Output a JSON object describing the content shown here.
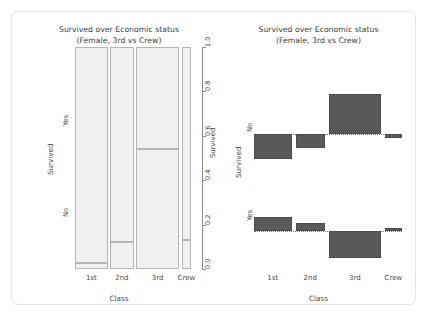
{
  "figure": {
    "title_line1": "Survived over Economic status",
    "title_line2": "(Female, 3rd vs Crew)",
    "background": "#ffffff",
    "panel_border_color": "#e4e4e4"
  },
  "chart_data": [
    {
      "type": "bar",
      "subtype": "mosaic",
      "title": "Survived over Economic status\n(Female, 3rd vs Crew)",
      "title_line1": "Survived over Economic status",
      "title_line2": "(Female, 3rd vs Crew)",
      "xlabel": "Class",
      "ylabel": "Survived",
      "categories": [
        "1st",
        "2nd",
        "3rd",
        "Crew"
      ],
      "row_categories": [
        "Yes",
        "No"
      ],
      "ylim": [
        0.0,
        1.0
      ],
      "right_axis_ticks": [
        "0.0",
        "0.2",
        "0.4",
        "0.6",
        "0.8",
        "1.0"
      ],
      "right_axis_label": "Survived",
      "grid": false,
      "legend": "none",
      "column_widths": [
        0.285,
        0.205,
        0.375,
        0.085
      ],
      "series": [
        {
          "name": "Yes",
          "values": [
            0.972,
            0.877,
            0.459,
            0.87
          ]
        },
        {
          "name": "No",
          "values": [
            0.028,
            0.123,
            0.541,
            0.13
          ]
        }
      ],
      "cell_fill": "#f0f0f0",
      "cell_border": "#b6b6b6"
    },
    {
      "type": "bar",
      "subtype": "association",
      "title": "Survived over Economic status\n(Female, 3rd vs Crew)",
      "title_line1": "Survived over Economic status",
      "title_line2": "(Female, 3rd vs Crew)",
      "xlabel": "Class",
      "ylabel": "Survived",
      "categories": [
        "1st",
        "2nd",
        "3rd",
        "Crew"
      ],
      "row_categories": [
        "No",
        "Yes"
      ],
      "grid": false,
      "legend": "none",
      "baseline_style": "dotted",
      "bar_color": "#595959",
      "bar_border": "#4c4c4c",
      "series": [
        {
          "name": "No",
          "values": [
            -4.45,
            -2.55,
            7.15,
            -0.85
          ]
        },
        {
          "name": "Yes",
          "values": [
            2.55,
            1.45,
            -4.85,
            0.55
          ]
        }
      ],
      "bar_widths": [
        0.185,
        0.145,
        0.255,
        0.085
      ]
    }
  ],
  "mosaic": {
    "title_line1": "Survived over Economic status",
    "title_line2": "(Female, 3rd vs Crew)",
    "x_title": "Class",
    "y_title": "Survived",
    "right_axis_title": "Survived",
    "x_labels": [
      "1st",
      "2nd",
      "3rd",
      "Crew"
    ],
    "row_label_yes": "Yes",
    "row_label_no": "No",
    "right_ticks": [
      "0.0",
      "0.2",
      "0.4",
      "0.6",
      "0.8",
      "1.0"
    ]
  },
  "assoc": {
    "title_line1": "Survived over Economic status",
    "title_line2": "(Female, 3rd vs Crew)",
    "x_title": "Class",
    "y_title": "Survived",
    "x_labels": [
      "1st",
      "2nd",
      "3rd",
      "Crew"
    ],
    "row_label_no": "No",
    "row_label_yes": "Yes"
  }
}
